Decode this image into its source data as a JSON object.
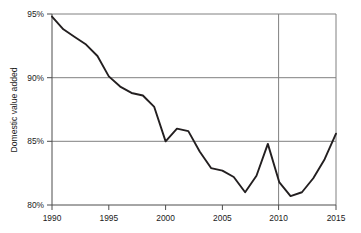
{
  "figure": {
    "background_color": "#ffffff",
    "width": 361,
    "height": 233
  },
  "chart_data": {
    "type": "line",
    "title": "",
    "subtitle": "",
    "xlabel": "",
    "ylabel": "Domestic value added",
    "xlim": [
      1990,
      2015
    ],
    "ylim": [
      80,
      95
    ],
    "x_tick_labels": [
      "1990",
      "1995",
      "2000",
      "2005",
      "2010",
      "2015"
    ],
    "x_ticks": [
      1990,
      1995,
      2000,
      2005,
      2010,
      2015
    ],
    "y_tick_labels": [
      "80%",
      "85%",
      "90%",
      "95%"
    ],
    "y_ticks": [
      80,
      85,
      90,
      95
    ],
    "y_unit": "%",
    "grid": {
      "horizontal": true,
      "vertical": true,
      "horizontal_at": [
        85,
        90,
        95
      ],
      "vertical_at": [
        2010
      ],
      "color": "#808080"
    },
    "legend": {
      "visible": false,
      "position": "none",
      "entries": []
    },
    "annotations": [],
    "line_color": "#231f20",
    "line_width": 1.9,
    "markers": false,
    "x": [
      1990,
      1991,
      1992,
      1993,
      1994,
      1995,
      1996,
      1997,
      1998,
      1999,
      2000,
      2001,
      2002,
      2003,
      2004,
      2005,
      2006,
      2007,
      2008,
      2009,
      2010,
      2011,
      2012,
      2013,
      2014,
      2015
    ],
    "series": [
      {
        "name": "Domestic value added",
        "values": [
          94.8,
          93.8,
          93.2,
          92.6,
          91.7,
          90.1,
          89.3,
          88.8,
          88.6,
          87.7,
          85.0,
          86.0,
          85.8,
          84.2,
          82.9,
          82.7,
          82.2,
          81.0,
          82.3,
          84.8,
          81.8,
          80.7,
          81.0,
          82.1,
          83.6,
          85.6
        ]
      }
    ]
  },
  "axes": {
    "y_axis_title": "Domestic value added",
    "y_tick_0": "80%",
    "y_tick_1": "85%",
    "y_tick_2": "90%",
    "y_tick_3": "95%",
    "x_tick_0": "1990",
    "x_tick_1": "1995",
    "x_tick_2": "2000",
    "x_tick_3": "2005",
    "x_tick_4": "2010",
    "x_tick_5": "2015"
  }
}
